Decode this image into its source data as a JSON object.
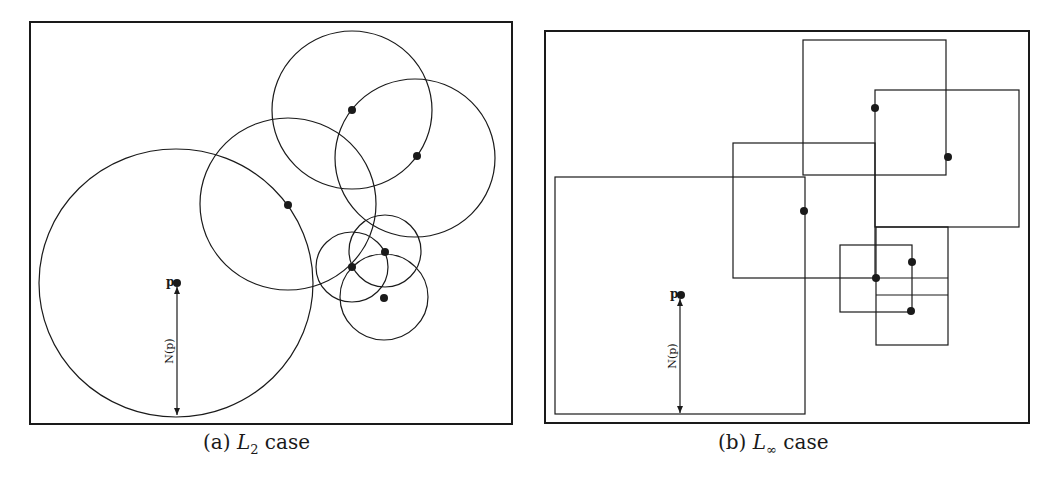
{
  "figure": {
    "panels": [
      {
        "id": "a",
        "caption_prefix": "(a)",
        "caption_math": "L",
        "caption_subscript": "2",
        "caption_suffix": "case",
        "point_label": "p",
        "radius_label": "N(p)",
        "frame": {
          "x": 30,
          "y": 22,
          "w": 482,
          "h": 402
        },
        "query_point": {
          "x": 177,
          "y": 283
        },
        "arrow": {
          "x": 177,
          "y1": 287,
          "y2": 415
        },
        "circles": [
          {
            "cx": 176,
            "cy": 283,
            "rx": 137,
            "ry": 134
          },
          {
            "cx": 288,
            "cy": 204,
            "rx": 88,
            "ry": 86
          },
          {
            "cx": 352,
            "cy": 110,
            "rx": 80,
            "ry": 79
          },
          {
            "cx": 415,
            "cy": 158,
            "rx": 80,
            "ry": 79
          },
          {
            "cx": 352,
            "cy": 267,
            "rx": 36,
            "ry": 35
          },
          {
            "cx": 385,
            "cy": 251,
            "rx": 36,
            "ry": 36
          },
          {
            "cx": 384,
            "cy": 297,
            "rx": 44,
            "ry": 43
          }
        ],
        "points": [
          {
            "x": 288,
            "y": 205
          },
          {
            "x": 352,
            "y": 110
          },
          {
            "x": 417,
            "y": 156
          },
          {
            "x": 352,
            "y": 267
          },
          {
            "x": 385,
            "y": 252
          },
          {
            "x": 384,
            "y": 298
          }
        ]
      },
      {
        "id": "b",
        "caption_prefix": "(b)",
        "caption_math": "L",
        "caption_subscript": "∞",
        "caption_suffix": "case",
        "point_label": "p",
        "radius_label": "N(p)",
        "frame": {
          "x": 545,
          "y": 31,
          "w": 484,
          "h": 392
        },
        "query_point": {
          "x": 681,
          "y": 295
        },
        "arrow": {
          "x": 680,
          "y1": 299,
          "y2": 413
        },
        "squares": [
          {
            "x": 555,
            "y": 177,
            "w": 250,
            "h": 237
          },
          {
            "x": 803,
            "y": 40,
            "w": 143,
            "h": 135
          },
          {
            "x": 875,
            "y": 90,
            "w": 144,
            "h": 137
          },
          {
            "x": 733,
            "y": 143,
            "w": 142,
            "h": 135
          },
          {
            "x": 840,
            "y": 245,
            "w": 72,
            "h": 67
          },
          {
            "x": 876,
            "y": 227,
            "w": 72,
            "h": 118
          }
        ],
        "extra_lines": [
          {
            "x1": 876,
            "y1": 278,
            "x2": 948,
            "y2": 278
          },
          {
            "x1": 876,
            "y1": 295,
            "x2": 948,
            "y2": 295
          }
        ],
        "points": [
          {
            "x": 875,
            "y": 108
          },
          {
            "x": 948,
            "y": 157
          },
          {
            "x": 804,
            "y": 211
          },
          {
            "x": 876,
            "y": 278
          },
          {
            "x": 912,
            "y": 262
          },
          {
            "x": 911,
            "y": 311
          }
        ]
      }
    ],
    "colors": {
      "stroke": "#1a1a1a",
      "background": "#ffffff"
    }
  }
}
